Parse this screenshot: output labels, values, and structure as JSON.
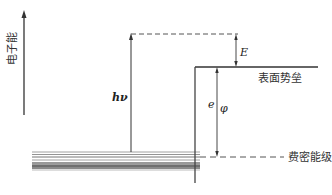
{
  "diagram": {
    "type": "energy-level diagram (photoemission / work function)",
    "axis": {
      "label": "电子能",
      "direction": "up"
    },
    "labels": {
      "photon_energy": "hν",
      "kinetic_energy": "E",
      "work_function_e": "e",
      "work_function_phi": "φ",
      "surface_barrier": "表面势垒",
      "fermi_level": "费密能级"
    },
    "colors": {
      "line": "#333333",
      "dashed": "#555555",
      "band_dark": "#666666",
      "band_light": "#999999"
    }
  }
}
